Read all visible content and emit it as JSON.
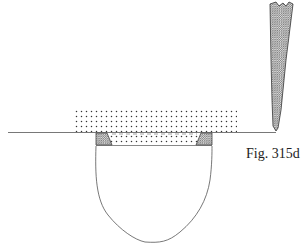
{
  "figure": {
    "caption": "Fig. 315d",
    "elements": [
      {
        "name": "baseline",
        "description": "horizontal surface line"
      },
      {
        "name": "stippled-block",
        "description": "dotted (stippled) material layer above and within the recess"
      },
      {
        "name": "left-hatched-insert",
        "description": "cross-hatched trapezoid at left edge of recess"
      },
      {
        "name": "right-hatched-insert",
        "description": "cross-hatched trapezoid at right edge of recess"
      },
      {
        "name": "bowl-cavity",
        "description": "rounded U-shaped cavity below the surface"
      },
      {
        "name": "pointed-instrument",
        "description": "hatched tapering tool/blade touching the baseline at right"
      }
    ]
  },
  "colors": {
    "line": "#555555",
    "hatch": "#777777",
    "stipple": "#333333",
    "background": "#ffffff"
  }
}
